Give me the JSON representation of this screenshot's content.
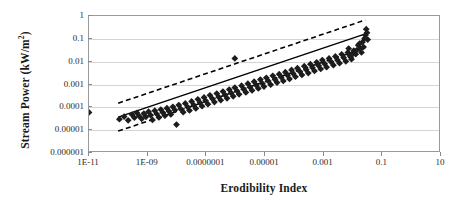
{
  "chart_data": {
    "type": "scatter",
    "title": "",
    "xlabel": "Erodibility Index",
    "ylabel": "Stream Power (kW/m²)",
    "ylabel_text": "Stream Power (kW/m",
    "ylabel_sup": "2",
    "ylabel_tail": ")",
    "xscale": "log",
    "yscale": "log",
    "xlim": [
      1e-11,
      10
    ],
    "ylim": [
      1e-06,
      1
    ],
    "grid": "horizontal",
    "legend": "none",
    "xticks": [
      1e-11,
      1e-09,
      1e-07,
      1e-05,
      0.001,
      0.1,
      10
    ],
    "xticklabels": [
      "1E-11",
      "1E-09",
      "0.0000001",
      "0.00001",
      "0.001",
      "0.1",
      "10"
    ],
    "yticks": [
      1,
      0.1,
      0.01,
      0.001,
      0.0001,
      1e-05,
      1e-06
    ],
    "yticklabels": [
      "1",
      "0.1",
      "0.01",
      "0.001",
      "0.0001",
      "0.00001",
      "0.000001"
    ],
    "marker": "diamond",
    "marker_color": "#1c1c1c",
    "marker_size": 3.4,
    "fit_line": {
      "style": "solid",
      "color": "#000000",
      "width": 1.5,
      "x_start": 1e-10,
      "y_start": 3.2e-05,
      "x_end": 0.03,
      "y_end": 0.16
    },
    "confidence_bands": {
      "style": "dashed",
      "color": "#000000",
      "width": 1.6,
      "upper_offset_decades": 0.62,
      "lower_offset_decades": 0.62
    },
    "points": [
      [
        1e-11,
        5.2e-05
      ],
      [
        1.1e-10,
        2.6e-05
      ],
      [
        1.6e-10,
        3.4e-05
      ],
      [
        2.2e-10,
        2.3e-05
      ],
      [
        3e-10,
        4.1e-05
      ],
      [
        3.6e-10,
        3e-05
      ],
      [
        4.4e-10,
        5e-05
      ],
      [
        5.2e-10,
        3.6e-05
      ],
      [
        6.4e-10,
        2.7e-05
      ],
      [
        7.6e-10,
        4.6e-05
      ],
      [
        9e-10,
        3.3e-05
      ],
      [
        1.1e-09,
        5.6e-05
      ],
      [
        1.3e-09,
        3.9e-05
      ],
      [
        1.5e-09,
        2.4e-05
      ],
      [
        1.8e-09,
        6.2e-05
      ],
      [
        2.1e-09,
        4.4e-05
      ],
      [
        2.5e-09,
        3.1e-05
      ],
      [
        2.9e-09,
        7e-05
      ],
      [
        3.4e-09,
        5.1e-05
      ],
      [
        4e-09,
        3.7e-05
      ],
      [
        4.7e-09,
        8e-05
      ],
      [
        5.5e-09,
        5.9e-05
      ],
      [
        6.4e-09,
        4.2e-05
      ],
      [
        7.5e-09,
        9.2e-05
      ],
      [
        8.8e-09,
        6.6e-05
      ],
      [
        1e-08,
        1.5e-05
      ],
      [
        1.2e-08,
        0.00011
      ],
      [
        1.4e-08,
        7.4e-05
      ],
      [
        1.7e-08,
        5.3e-05
      ],
      [
        2e-08,
        0.00013
      ],
      [
        2.4e-08,
        9e-05
      ],
      [
        2.8e-08,
        6.3e-05
      ],
      [
        3.3e-08,
        0.00016
      ],
      [
        3.9e-08,
        0.00011
      ],
      [
        4.6e-08,
        7.8e-05
      ],
      [
        5.4e-08,
        0.0002
      ],
      [
        6.4e-08,
        0.00014
      ],
      [
        7.5e-08,
        9.8e-05
      ],
      [
        8.8e-08,
        0.00024
      ],
      [
        1e-07,
        0.00017
      ],
      [
        1.2e-07,
        0.00012
      ],
      [
        1.4e-07,
        0.0003
      ],
      [
        1.7e-07,
        0.00021
      ],
      [
        2e-07,
        0.00015
      ],
      [
        2.4e-07,
        0.00036
      ],
      [
        2.8e-07,
        0.00025
      ],
      [
        3.3e-07,
        0.00018
      ],
      [
        3.9e-07,
        0.00044
      ],
      [
        4.6e-07,
        0.00031
      ],
      [
        5.4e-07,
        0.00022
      ],
      [
        6.4e-07,
        0.00054
      ],
      [
        7.5e-07,
        0.00038
      ],
      [
        8.8e-07,
        0.00027
      ],
      [
        1e-06,
        0.00066
      ],
      [
        1e-06,
        0.013
      ],
      [
        1.2e-06,
        0.00046
      ],
      [
        1.4e-06,
        0.00033
      ],
      [
        1.7e-06,
        0.0008
      ],
      [
        2e-06,
        0.00056
      ],
      [
        2.4e-06,
        0.0004
      ],
      [
        2.8e-06,
        0.00098
      ],
      [
        3.3e-06,
        0.00069
      ],
      [
        3.9e-06,
        0.00049
      ],
      [
        4.6e-06,
        0.0012
      ],
      [
        5.4e-06,
        0.00084
      ],
      [
        6.4e-06,
        0.0006
      ],
      [
        7.5e-06,
        0.0015
      ],
      [
        8.8e-06,
        0.001
      ],
      [
        1e-05,
        0.00073
      ],
      [
        1.2e-05,
        0.0018
      ],
      [
        1.4e-05,
        0.0013
      ],
      [
        1.7e-05,
        0.00089
      ],
      [
        2e-05,
        0.0022
      ],
      [
        2.4e-05,
        0.0015
      ],
      [
        2.8e-05,
        0.0011
      ],
      [
        3.3e-05,
        0.0026
      ],
      [
        3.9e-05,
        0.0019
      ],
      [
        4.6e-05,
        0.0013
      ],
      [
        5.4e-05,
        0.0032
      ],
      [
        6.4e-05,
        0.0023
      ],
      [
        7.5e-05,
        0.0016
      ],
      [
        8.8e-05,
        0.004
      ],
      [
        0.0001,
        0.0028
      ],
      [
        0.00012,
        0.002
      ],
      [
        0.00014,
        0.0048
      ],
      [
        0.00017,
        0.0034
      ],
      [
        0.0002,
        0.0024
      ],
      [
        0.00024,
        0.0059
      ],
      [
        0.00028,
        0.0041
      ],
      [
        0.00033,
        0.0029
      ],
      [
        0.00039,
        0.0072
      ],
      [
        0.00046,
        0.005
      ],
      [
        0.00054,
        0.0036
      ],
      [
        0.00064,
        0.0088
      ],
      [
        0.00075,
        0.0062
      ],
      [
        0.00088,
        0.0044
      ],
      [
        0.001,
        0.011
      ],
      [
        0.0012,
        0.0075
      ],
      [
        0.0014,
        0.0053
      ],
      [
        0.0017,
        0.013
      ],
      [
        0.002,
        0.0092
      ],
      [
        0.0024,
        0.0065
      ],
      [
        0.0028,
        0.016
      ],
      [
        0.0033,
        0.011
      ],
      [
        0.0039,
        0.008
      ],
      [
        0.0046,
        0.02
      ],
      [
        0.0054,
        0.014
      ],
      [
        0.0064,
        0.0097
      ],
      [
        0.0075,
        0.024
      ],
      [
        0.0088,
        0.017
      ],
      [
        0.01,
        0.012
      ],
      [
        0.012,
        0.029
      ],
      [
        0.014,
        0.02
      ],
      [
        0.017,
        0.05
      ],
      [
        0.02,
        0.035
      ],
      [
        0.024,
        0.07
      ],
      [
        0.028,
        0.1
      ],
      [
        0.03,
        0.14
      ],
      [
        0.032,
        0.26
      ],
      [
        0.034,
        0.18
      ],
      [
        0.036,
        0.09
      ],
      [
        0.026,
        0.042
      ],
      [
        0.022,
        0.024
      ],
      [
        0.019,
        0.06
      ],
      [
        0.015,
        0.03
      ],
      [
        0.011,
        0.022
      ],
      [
        0.0095,
        0.015
      ],
      [
        0.008,
        0.036
      ]
    ]
  }
}
